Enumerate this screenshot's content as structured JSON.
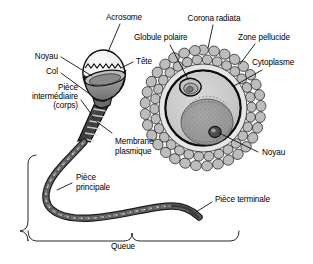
{
  "figure": {
    "language": "fr",
    "style": "grayscale line drawing"
  },
  "colors": {
    "ink": "#1a1a1a",
    "outline": "#000000",
    "cytoplasm": "#c8c8c8",
    "nucleus_fill": "#9a9a9a",
    "zone_pellucide": "#e2e2e2",
    "corona_fill": "#b4b4b4",
    "head_light": "#ececec",
    "head_dark": "#8f8f8f",
    "tail": "#4a4a4a",
    "background": "#ffffff"
  },
  "sperm": {
    "name": "spermatozoide",
    "labels": {
      "acrosome": "Acrosome",
      "tete": "Tête",
      "noyau": "Noyau",
      "col": "Col",
      "piece_intermediaire_l1": "Pièce",
      "piece_intermediaire_l2": "intermédiaire",
      "piece_intermediaire_l3": "(corps)",
      "membrane_l1": "Membrane",
      "membrane_l2": "plasmique",
      "piece_principale_l1": "Pièce",
      "piece_principale_l2": "principale",
      "piece_terminale": "Pièce terminale",
      "queue": "Queue"
    }
  },
  "ovocyte": {
    "name": "ovocyte",
    "labels": {
      "corona_radiata": "Corona radiata",
      "globule_polaire": "Globule polaire",
      "zone_pellucide": "Zone pellucide",
      "cytoplasme": "Cytoplasme",
      "noyau": "Noyau"
    }
  }
}
